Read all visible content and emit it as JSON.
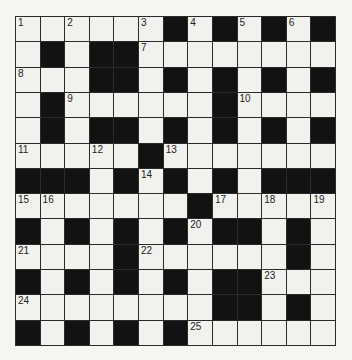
{
  "puzzle": {
    "type": "crossword",
    "rows": 13,
    "cols": 13,
    "colors": {
      "background": "#f5f5f2",
      "white_cell": "#f1f1ee",
      "black_cell": "#121212",
      "grid_line": "#2b2b2b",
      "number_text": "#222222"
    },
    "layout": [
      "WWWWWWBWBWBWB",
      "WBWBBWWWWWWWW",
      "WWWBBWBWBWBWB",
      "WBWWWWWWBWWWW",
      "WBWBBWBWBWBWB",
      "WWWWWBWWWWWWW",
      "BBBWBWBWBWBBB",
      "WWWWWWWBWWWWW",
      "BWBWBWBWBBWBW",
      "WWWWBWWWWWWBW",
      "BWBWBWBWBBWWW",
      "WWWWWWWWBBWBW",
      "BWBWBWBWWWWWW"
    ],
    "numbers": [
      {
        "row": 0,
        "col": 0,
        "n": "1"
      },
      {
        "row": 0,
        "col": 2,
        "n": "2"
      },
      {
        "row": 0,
        "col": 5,
        "n": "3"
      },
      {
        "row": 0,
        "col": 7,
        "n": "4"
      },
      {
        "row": 0,
        "col": 9,
        "n": "5"
      },
      {
        "row": 0,
        "col": 11,
        "n": "6"
      },
      {
        "row": 1,
        "col": 5,
        "n": "7"
      },
      {
        "row": 2,
        "col": 0,
        "n": "8"
      },
      {
        "row": 3,
        "col": 2,
        "n": "9"
      },
      {
        "row": 3,
        "col": 9,
        "n": "10"
      },
      {
        "row": 5,
        "col": 0,
        "n": "11"
      },
      {
        "row": 5,
        "col": 3,
        "n": "12"
      },
      {
        "row": 5,
        "col": 6,
        "n": "13"
      },
      {
        "row": 6,
        "col": 5,
        "n": "14"
      },
      {
        "row": 7,
        "col": 0,
        "n": "15"
      },
      {
        "row": 7,
        "col": 1,
        "n": "16"
      },
      {
        "row": 7,
        "col": 8,
        "n": "17"
      },
      {
        "row": 7,
        "col": 10,
        "n": "18"
      },
      {
        "row": 7,
        "col": 12,
        "n": "19"
      },
      {
        "row": 8,
        "col": 7,
        "n": "20"
      },
      {
        "row": 9,
        "col": 0,
        "n": "21"
      },
      {
        "row": 9,
        "col": 5,
        "n": "22"
      },
      {
        "row": 10,
        "col": 10,
        "n": "23"
      },
      {
        "row": 11,
        "col": 0,
        "n": "24"
      },
      {
        "row": 12,
        "col": 7,
        "n": "25"
      }
    ],
    "entries": []
  }
}
